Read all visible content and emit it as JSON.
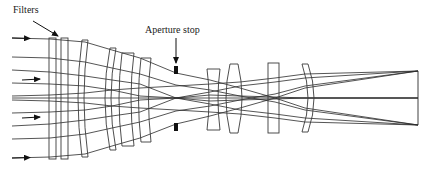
{
  "diagram": {
    "labels": {
      "filters": "Filters",
      "aperture_stop": "Aperture stop"
    },
    "colors": {
      "line": "#2a2a2a",
      "stop": "#111111",
      "background": "#ffffff"
    },
    "components": [
      {
        "id": "filter-1",
        "type": "filter"
      },
      {
        "id": "filter-2",
        "type": "filter"
      },
      {
        "id": "lens-1",
        "type": "meniscus-lens"
      },
      {
        "id": "lens-2",
        "type": "meniscus-lens"
      },
      {
        "id": "lens-3",
        "type": "meniscus-lens"
      },
      {
        "id": "lens-4",
        "type": "meniscus-lens"
      },
      {
        "id": "aperture-stop",
        "type": "stop"
      },
      {
        "id": "lens-5",
        "type": "concave-lens"
      },
      {
        "id": "lens-6",
        "type": "biconvex-lens"
      },
      {
        "id": "lens-7",
        "type": "plate"
      },
      {
        "id": "lens-8",
        "type": "meniscus-lens"
      },
      {
        "id": "image-plane",
        "type": "image-plane"
      }
    ],
    "input_ray_arrows": 4,
    "focus_points": 3
  }
}
